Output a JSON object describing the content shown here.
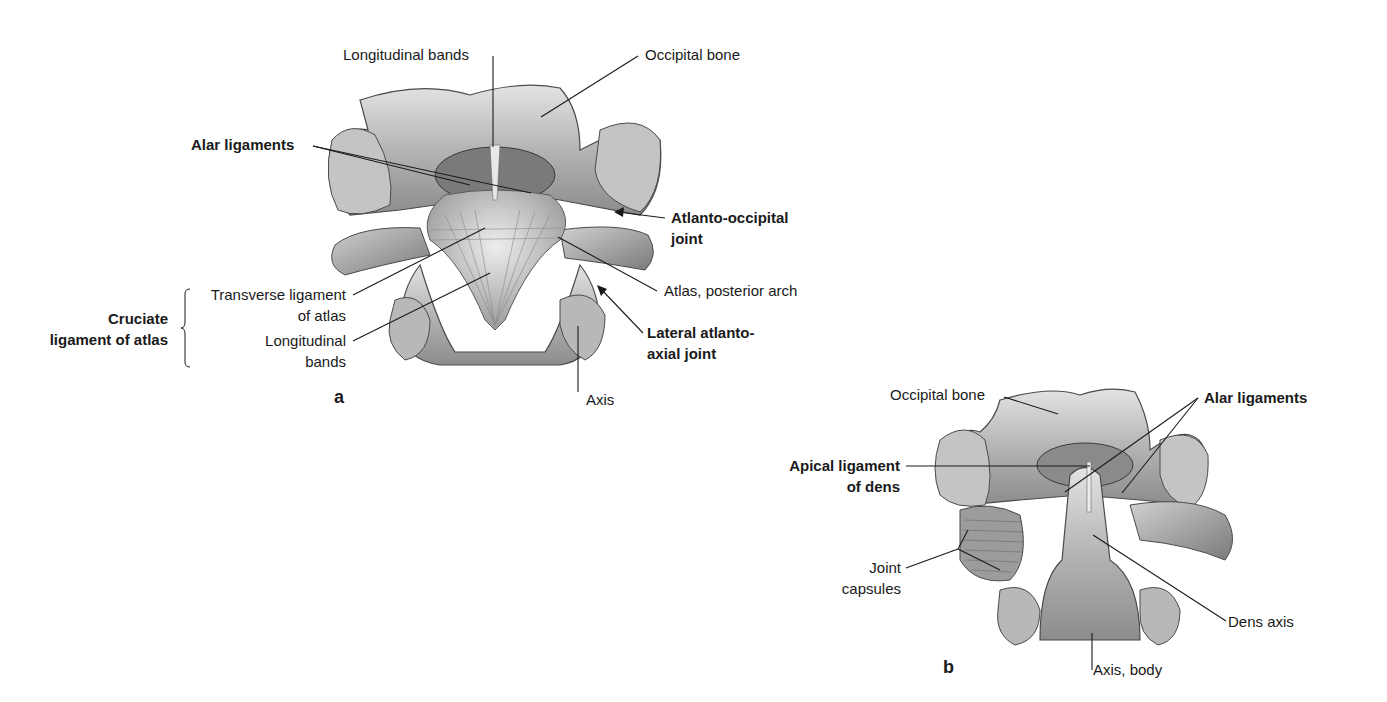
{
  "figure_a": {
    "panel_letter": "a",
    "labels": {
      "longitudinal_bands_top": "Longitudinal bands",
      "occipital_bone": "Occipital bone",
      "alar_ligaments": "Alar ligaments",
      "atlanto_occipital_joint_l1": "Atlanto-occipital",
      "atlanto_occipital_joint_l2": "joint",
      "transverse_ligament_l1": "Transverse ligament",
      "transverse_ligament_l2": "of atlas",
      "longitudinal_bands_l1": "Longitudinal",
      "longitudinal_bands_l2": "bands",
      "cruciate_l1": "Cruciate",
      "cruciate_l2": "ligament of atlas",
      "atlas_posterior_arch": "Atlas, posterior arch",
      "lateral_atlanto_axial_l1": "Lateral atlanto-",
      "lateral_atlanto_axial_l2": "axial joint",
      "axis": "Axis"
    }
  },
  "figure_b": {
    "panel_letter": "b",
    "labels": {
      "occipital_bone": "Occipital bone",
      "alar_ligaments": "Alar ligaments",
      "apical_ligament_l1": "Apical ligament",
      "apical_ligament_l2": "of dens",
      "joint_capsules_l1": "Joint",
      "joint_capsules_l2": "capsules",
      "dens_axis": "Dens axis",
      "axis_body": "Axis, body"
    }
  },
  "colors": {
    "bone_light": "#d9d9d9",
    "bone_mid": "#a8a8a8",
    "bone_dark": "#5a5a5a",
    "leader_line": "#1a1a1a",
    "text": "#1a1a1a"
  }
}
